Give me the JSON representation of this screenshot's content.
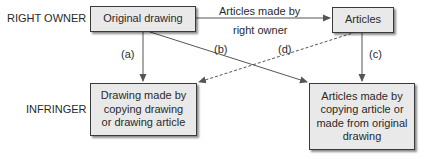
{
  "rows": {
    "right_owner": "RIGHT OWNER",
    "infringer": "INFRINGER"
  },
  "nodes": {
    "original_drawing": "Original drawing",
    "articles": "Articles",
    "infringing_drawing": [
      "Drawing made by",
      "copying drawing",
      "or drawing article"
    ],
    "infringing_articles": [
      "Articles made by",
      "copying article or",
      "made from original",
      "drawing"
    ]
  },
  "edges": {
    "top_label_line1": "Articles made by",
    "top_label_line2": "right owner",
    "a": "(a)",
    "b": "(b)",
    "c": "(c)",
    "d": "(d)"
  },
  "colors": {
    "box_fill": "#e9e9e9",
    "line": "#555555",
    "text": "#2a2a2a"
  }
}
